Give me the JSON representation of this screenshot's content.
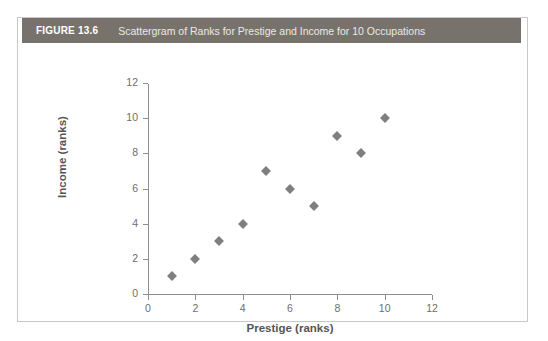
{
  "figure": {
    "number": "FIGURE 13.6",
    "title": "Scattergram of Ranks for Prestige and Income for 10 Occupations",
    "header_color": "#77736c",
    "frame_border_color": "#c8c8c8"
  },
  "chart_data": {
    "type": "scatter",
    "title": "Scattergram of Ranks for Prestige and Income for 10 Occupations",
    "xlabel": "Prestige (ranks)",
    "ylabel": "Income (ranks)",
    "xlim": [
      0,
      12
    ],
    "ylim": [
      0,
      12
    ],
    "xticks": [
      0,
      2,
      4,
      6,
      8,
      10,
      12
    ],
    "yticks": [
      0,
      2,
      4,
      6,
      8,
      10,
      12
    ],
    "grid": false,
    "legend": null,
    "marker": "diamond",
    "marker_color": "#7f7f7f",
    "x": [
      1,
      2,
      3,
      4,
      5,
      6,
      7,
      8,
      9,
      10
    ],
    "y": [
      1,
      2,
      3,
      4,
      7,
      6,
      5,
      9,
      8,
      10
    ],
    "points": [
      {
        "x": 1,
        "y": 1
      },
      {
        "x": 2,
        "y": 2
      },
      {
        "x": 3,
        "y": 3
      },
      {
        "x": 4,
        "y": 4
      },
      {
        "x": 5,
        "y": 7
      },
      {
        "x": 6,
        "y": 6
      },
      {
        "x": 7,
        "y": 5
      },
      {
        "x": 8,
        "y": 9
      },
      {
        "x": 9,
        "y": 8
      },
      {
        "x": 10,
        "y": 10
      }
    ]
  }
}
